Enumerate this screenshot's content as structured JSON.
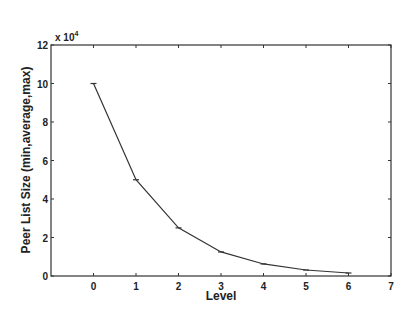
{
  "chart_data": {
    "type": "line",
    "title": "",
    "xlabel": "Level",
    "ylabel": "Peer List Size (min,average,max)",
    "y_multiplier": "x 10",
    "y_multiplier_exp": "4",
    "x": [
      0,
      1,
      2,
      3,
      4,
      5,
      6
    ],
    "series": [
      {
        "name": "Peer List Size",
        "values": [
          100000,
          50000,
          25000,
          12500,
          6250,
          3125,
          1562
        ]
      }
    ],
    "xlim": [
      -1,
      7
    ],
    "ylim": [
      0,
      120000
    ],
    "x_ticks": [
      0,
      1,
      2,
      3,
      4,
      5,
      6,
      7
    ],
    "x_tick_labels": [
      "0",
      "1",
      "2",
      "3",
      "4",
      "5",
      "6",
      "7"
    ],
    "y_ticks": [
      0,
      2,
      4,
      6,
      8,
      10,
      12
    ],
    "y_tick_labels": [
      "0",
      "2",
      "4",
      "6",
      "8",
      "10",
      "12"
    ],
    "grid": false,
    "legend": null,
    "line_color": "#333333",
    "axis_color": "#333333"
  }
}
